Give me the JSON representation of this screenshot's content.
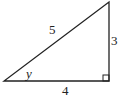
{
  "diagram": {
    "type": "right-triangle",
    "labels": {
      "hypotenuse": "5",
      "vertical_leg": "3",
      "horizontal_leg": "4",
      "angle": "y"
    },
    "stroke_color": "#222222"
  }
}
